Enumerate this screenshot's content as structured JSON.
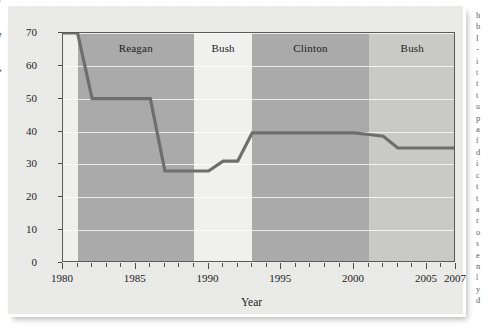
{
  "figure": {
    "caption_hidden": true
  },
  "chart_data": {
    "type": "line",
    "title": "",
    "xlabel": "Year",
    "ylabel": "Top Rate (percent)",
    "xlim": [
      1980,
      2007
    ],
    "ylim": [
      0,
      70
    ],
    "grid": true,
    "legend_position": "none",
    "x_ticks_major": [
      1980,
      1985,
      1990,
      1995,
      2000,
      2005,
      2007
    ],
    "x_ticks_minor_step": 1,
    "y_ticks": [
      0,
      10,
      20,
      30,
      40,
      50,
      60,
      70
    ],
    "series": [
      {
        "name": "Top marginal income tax rate",
        "color": "#6e6e6e",
        "x": [
          1980,
          1981,
          1982,
          1986,
          1987,
          1988,
          1990,
          1991,
          1992,
          1993,
          2000,
          2001,
          2002,
          2003,
          2007
        ],
        "values": [
          70,
          70,
          50,
          50,
          28,
          28,
          28,
          31,
          31,
          39.6,
          39.6,
          39.1,
          38.6,
          35,
          35
        ]
      }
    ],
    "bands": [
      {
        "label": "Reagan",
        "start": 1981,
        "end": 1989,
        "shade": "#aaaaaa"
      },
      {
        "label": "Bush",
        "start": 1989,
        "end": 1993,
        "shade": "#f0f0ee"
      },
      {
        "label": "Clinton",
        "start": 1993,
        "end": 2001,
        "shade": "#aaaaaa"
      },
      {
        "label": "Bush",
        "start": 2001,
        "end": 2007,
        "shade": "#c9c9c7"
      }
    ],
    "annotations": []
  },
  "axis": {
    "y_tick_labels": [
      "70",
      "60",
      "50",
      "40",
      "30",
      "20",
      "10",
      "0"
    ],
    "x_tick_labels": [
      {
        "label": "1980",
        "value": 1980
      },
      {
        "label": "1985",
        "value": 1985
      },
      {
        "label": "1990",
        "value": 1990
      },
      {
        "label": "1995",
        "value": 1995
      },
      {
        "label": "2000",
        "value": 2000
      },
      {
        "label": "2005",
        "value": 2005
      },
      {
        "label": "2007",
        "value": 2007
      }
    ],
    "x_title": "Year",
    "y_title": "Top Rate (percent)"
  },
  "side_text": {
    "lines": [
      "h",
      "b",
      "I",
      "-",
      "i",
      "t",
      "t",
      "t",
      "u",
      "p",
      "a",
      "f",
      "d",
      "i",
      "c",
      "t",
      "t",
      "a",
      "r",
      "o",
      "s",
      "e",
      "n",
      "l",
      "y",
      "d"
    ]
  },
  "colors": {
    "page": "#ececea",
    "plot_bg": "#efefed",
    "band_dark": "#aaaaaa",
    "band_light": "#f0f0ee",
    "band_mid": "#c9c9c7",
    "line": "#6e6e6e",
    "frame": "#5a5a5a",
    "text": "#1c1c1c",
    "gridline": "#ffffff"
  }
}
